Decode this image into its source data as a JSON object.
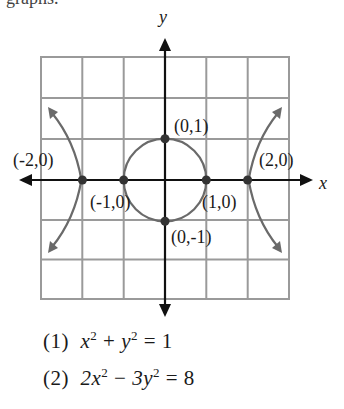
{
  "top_text_cropped": "graphs.",
  "axes": {
    "x_label": "x",
    "y_label": "y"
  },
  "colors": {
    "grid": "#9a9a9a",
    "axis": "#111111",
    "curve": "#6a6a6a",
    "point": "#333333",
    "text": "#1a1a1a"
  },
  "points": [
    {
      "label": "(0,1)",
      "x": 0,
      "y": 1
    },
    {
      "label": "(-2,0)",
      "x": -2,
      "y": 0
    },
    {
      "label": "(2,0)",
      "x": 2,
      "y": 0
    },
    {
      "label": "(-1,0)",
      "x": -1,
      "y": 0
    },
    {
      "label": "(1,0)",
      "x": 1,
      "y": 0
    },
    {
      "label": "(0,-1)",
      "x": 0,
      "y": -1
    }
  ],
  "equations": [
    {
      "num": "(1)",
      "parts": [
        "x",
        "2",
        " + ",
        "y",
        "2",
        " = 1"
      ]
    },
    {
      "num": "(2)",
      "parts": [
        "2x",
        "2",
        " − ",
        "3y",
        "2",
        " = 8"
      ]
    }
  ],
  "grid": {
    "x_range": [
      -3,
      3
    ],
    "y_range": [
      -3,
      3
    ],
    "step": 1
  }
}
